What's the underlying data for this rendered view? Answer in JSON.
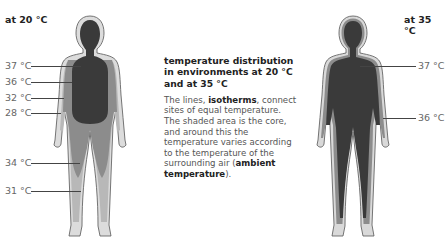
{
  "left_panel": {
    "title": "at 20 °C",
    "labels": [
      {
        "text": "37 °C",
        "y": 66
      },
      {
        "text": "36 °C",
        "y": 82
      },
      {
        "text": "32 °C",
        "y": 98
      },
      {
        "text": "28 °C",
        "y": 113
      },
      {
        "text": "34 °C",
        "y": 163
      },
      {
        "text": "31 °C",
        "y": 191
      }
    ]
  },
  "right_panel": {
    "title": "at 35 °C",
    "labels": [
      {
        "text": "37 °C",
        "y": 66
      },
      {
        "text": "36 °C",
        "y": 118
      }
    ]
  },
  "caption": {
    "heading": "temperature distribution in environments at 20 °C and at 35 °C",
    "body_pre": "The lines, ",
    "term1": "isotherms",
    "body_mid": ", connect sites of equal temperature. The shaded area is the core, and around this the temperature varies according to the temperature of the surrounding air (",
    "term2": "ambient temperature",
    "body_post": ")."
  },
  "colors": {
    "core": "#3a3a3a",
    "zone_mid": "#8a8a8a",
    "zone_light": "#b3b3b3",
    "skin": "#d9d9d9",
    "outline": "#555555"
  }
}
